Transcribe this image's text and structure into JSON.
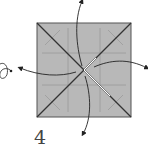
{
  "diagram": {
    "type": "origami-fold-step",
    "step_number": "4",
    "paper": {
      "fill": "#b8b8b8",
      "edge": "#555555",
      "crease": "#9a9a9a"
    },
    "diagonal_color": "#333333",
    "arrow_color": "#222222",
    "arrows": [
      {
        "direction": "up"
      },
      {
        "direction": "right"
      },
      {
        "direction": "left"
      },
      {
        "direction": "down"
      }
    ]
  }
}
